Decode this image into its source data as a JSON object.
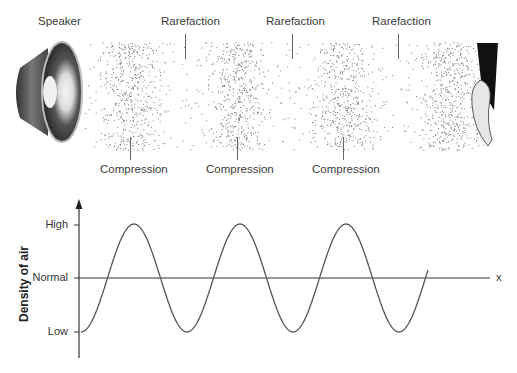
{
  "diagram": {
    "top": {
      "speaker_label": "Speaker",
      "rarefaction_labels": [
        "Rarefaction",
        "Rarefaction",
        "Rarefaction"
      ],
      "compression_labels": [
        "Compression",
        "Compression",
        "Compression"
      ],
      "icons": {
        "source": "speaker-icon",
        "receiver": "ear-icon"
      }
    },
    "graph": {
      "y_axis_title": "Density of air",
      "y_ticks": [
        "High",
        "Normal",
        "Low"
      ],
      "x_axis_label": "x"
    }
  },
  "chart_data": {
    "type": "line",
    "title": "",
    "xlabel": "x",
    "ylabel": "Density of air",
    "y_categories": [
      "Low",
      "Normal",
      "High"
    ],
    "series": [
      {
        "name": "Density of air",
        "shape": "sine",
        "start": "Low",
        "peaks": 3,
        "troughs": 2,
        "end": "Normal",
        "description": "Wave starts at Low, rises through Normal to High, repeats 3 peaks, ends at Normal"
      }
    ]
  },
  "colors": {
    "stroke": "#555555",
    "dots": "#777777"
  }
}
